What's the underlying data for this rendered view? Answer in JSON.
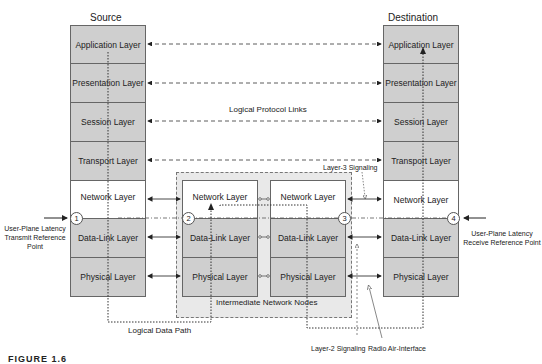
{
  "source": {
    "title": "Source",
    "layers": [
      "Application Layer",
      "Presentation Layer",
      "Session Layer",
      "Transport Layer",
      "Network Layer",
      "Data-Link Layer",
      "Physical Layer"
    ]
  },
  "destination": {
    "title": "Destination",
    "layers": [
      "Application Layer",
      "Presentation Layer",
      "Session Layer",
      "Transport Layer",
      "Network Layer",
      "Data-Link Layer",
      "Physical Layer"
    ]
  },
  "intermediate": {
    "label": "Intermediate Network Nodes",
    "node1": {
      "layers": [
        "Network Layer",
        "Data-Link Layer",
        "Physical Layer"
      ]
    },
    "node2": {
      "layers": [
        "Network Layer",
        "Data-Link Layer",
        "Physical Layer"
      ]
    }
  },
  "labels": {
    "logical_protocol_links": "Logical Protocol Links",
    "layer3_signaling": "Layer-3 Signaling",
    "layer2_signaling": "Layer-2 Signaling",
    "radio_air_interface": "Radio Air-Interface",
    "logical_data_path": "Logical Data Path",
    "tx_ref": "User-Plane Latency Transmit Reference Point",
    "rx_ref": "User-Plane Latency Receive Reference Point"
  },
  "reference_points": [
    "1",
    "2",
    "3",
    "4"
  ],
  "caption": "FIGURE 1.6",
  "colors": {
    "layer_fill": "#cfcfcf",
    "network_fill": "#ffffff",
    "container_fill": "#e9e9e9",
    "line": "#222222"
  }
}
